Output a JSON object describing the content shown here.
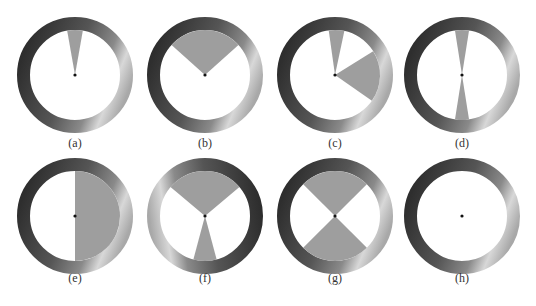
{
  "figure": {
    "ring": {
      "outer_radius": 58,
      "thickness": 13,
      "dark_color": "#2e2e2e",
      "mid_color": "#8a8a8a",
      "light_color": "#d8d8d8"
    },
    "wedge_color": "#9e9e9e",
    "center_dot_color": "#111111",
    "panels": [
      {
        "label": "(a)",
        "cx": 75,
        "cy": 75,
        "gradient_rotation": 0,
        "wedges": [
          [
            -10,
            10
          ]
        ]
      },
      {
        "label": "(b)",
        "cx": 205,
        "cy": 75,
        "gradient_rotation": 0,
        "wedges": [
          [
            -48,
            48
          ]
        ]
      },
      {
        "label": "(c)",
        "cx": 335,
        "cy": 75,
        "gradient_rotation": 0,
        "wedges": [
          [
            -8,
            12
          ],
          [
            58,
            125
          ]
        ]
      },
      {
        "label": "(d)",
        "cx": 462,
        "cy": 75,
        "gradient_rotation": 0,
        "wedges": [
          [
            -9,
            9
          ],
          [
            171,
            189
          ]
        ]
      },
      {
        "label": "(e)",
        "cx": 75,
        "cy": 216,
        "gradient_rotation": 0,
        "wedges": [
          [
            0,
            180
          ]
        ]
      },
      {
        "label": "(f)",
        "cx": 205,
        "cy": 216,
        "gradient_rotation": 150,
        "wedges": [
          [
            -50,
            50
          ],
          [
            165,
            195
          ]
        ]
      },
      {
        "label": "(g)",
        "cx": 335,
        "cy": 216,
        "gradient_rotation": 0,
        "wedges": [
          [
            -45,
            45
          ],
          [
            135,
            225
          ]
        ]
      },
      {
        "label": "(h)",
        "cx": 462,
        "cy": 216,
        "gradient_rotation": 0,
        "wedges": []
      }
    ]
  }
}
